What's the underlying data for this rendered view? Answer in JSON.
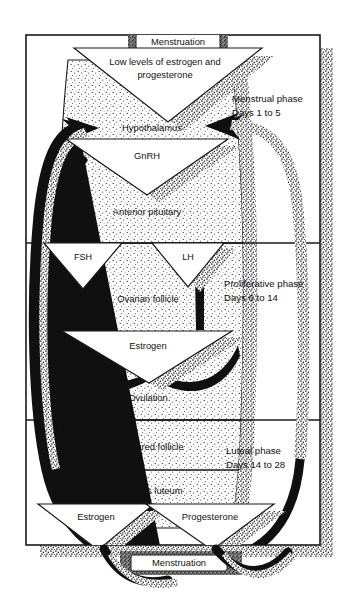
{
  "diagram": {
    "colors": {
      "ink": "#1a1a1a",
      "paper": "#ffffff",
      "stipple": "#2b2b2b",
      "arrow": "#101010"
    }
  },
  "nodes": {
    "menstruation_top": "Menstruation",
    "low_levels": "Low levels of estrogen and progesterone",
    "low_levels_line1": "Low levels of estrogen and",
    "low_levels_line2": "progesterone",
    "hypothalamus": "Hypothalamus",
    "gnrh": "GnRH",
    "anterior_pituitary": "Anterior pituitary",
    "fsh": "FSH",
    "lh": "LH",
    "ovarian_follicle": "Ovarian follicle",
    "estrogen_mid": "Estrogen",
    "ovulation": "Ovulation",
    "ruptured_follicle": "Ruptured follicle",
    "corpus_luteum": "Corpus luteum",
    "estrogen_bottom": "Estrogen",
    "progesterone_bottom": "Progesterone",
    "menstruation_bottom": "Menstruation"
  },
  "phases": [
    {
      "name": "Menstrual phase",
      "days": "Days 1 to 5",
      "line1": "Menstrual phase",
      "line2": "Days 1 to 5"
    },
    {
      "name": "Proliferative phase",
      "days": "Days 6 to 14",
      "line1": "Proliferative phase",
      "line2": "Days 6 to 14"
    },
    {
      "name": "Luteal phase",
      "days": "Days 14 to 28",
      "line1": "Luteal phase",
      "line2": "Days 14 to 28"
    }
  ],
  "icons": {
    "arrow_down_triangle": "down-triangle-arrow-icon",
    "arrow_up_black": "up-arrow-icon",
    "feedback_loop_left": "feedback-loop-arrow-icon",
    "feedback_loop_right": "feedback-loop-arrow-icon"
  }
}
